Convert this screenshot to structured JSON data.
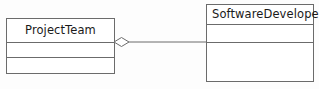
{
  "diagram": {
    "type": "uml-class-diagram",
    "background_color": "#fdfdfd",
    "line_color": "#6b6b6b",
    "text_color": "#1a1a1a",
    "classes": [
      {
        "id": "project-team",
        "name": "ProjectTeam",
        "title_align": "center",
        "attributes_text": "",
        "operations_text": "",
        "compartments": 3
      },
      {
        "id": "software-developer",
        "name": "SoftwareDeveloper",
        "title_align": "left",
        "attributes_text": "",
        "operations_text": "",
        "compartments": 3
      }
    ],
    "relationship": {
      "name": "aggregation",
      "kind": "aggregation",
      "marker": "hollow-diamond",
      "source": "ProjectTeam",
      "target": "SoftwareDeveloper",
      "source_role": "",
      "target_role": "",
      "source_multiplicity": "",
      "target_multiplicity": "",
      "label": ""
    }
  }
}
